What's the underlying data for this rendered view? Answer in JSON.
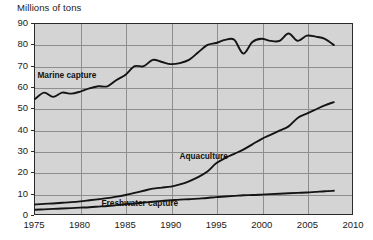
{
  "chart_data": {
    "type": "line",
    "title": "Millions of tons",
    "xlabel": "",
    "ylabel": "Millions of tons",
    "xlim": [
      1975,
      2010
    ],
    "ylim": [
      0,
      90
    ],
    "grid": true,
    "legend_position": "inline-labels",
    "xticks": [
      "1975",
      "1980",
      "1985",
      "1990",
      "1995",
      "2000",
      "2005",
      "2010"
    ],
    "yticks": [
      "0",
      "10",
      "20",
      "30",
      "40",
      "50",
      "60",
      "70",
      "80",
      "90"
    ],
    "series": [
      {
        "name": "Marine capture",
        "x": [
          1975,
          1976,
          1977,
          1978,
          1979,
          1980,
          1981,
          1982,
          1983,
          1984,
          1985,
          1986,
          1987,
          1988,
          1989,
          1990,
          1991,
          1992,
          1993,
          1994,
          1995,
          1996,
          1997,
          1998,
          1999,
          2000,
          2001,
          2002,
          2003,
          2004,
          2005,
          2006,
          2007,
          2008
        ],
        "values": [
          54.5,
          57.5,
          55.5,
          57.5,
          57.0,
          58.0,
          59.5,
          60.5,
          60.5,
          63.5,
          66.0,
          70.0,
          70.0,
          73.0,
          72.0,
          71.0,
          71.5,
          73.0,
          76.5,
          80.0,
          81.0,
          82.5,
          82.5,
          76.0,
          81.5,
          83.0,
          82.0,
          82.0,
          85.5,
          82.0,
          84.5,
          84.0,
          83.0,
          80.0
        ]
      },
      {
        "name": "Aquaculture",
        "x": [
          1975,
          1976,
          1977,
          1978,
          1979,
          1980,
          1981,
          1982,
          1983,
          1984,
          1985,
          1986,
          1987,
          1988,
          1989,
          1990,
          1991,
          1992,
          1993,
          1994,
          1995,
          1996,
          1997,
          1998,
          1999,
          2000,
          2001,
          2002,
          2003,
          2004,
          2005,
          2006,
          2007,
          2008
        ],
        "values": [
          4.5,
          4.8,
          5.0,
          5.3,
          5.6,
          6.0,
          6.5,
          7.0,
          7.5,
          8.2,
          9.0,
          10.0,
          11.0,
          12.0,
          12.5,
          13.0,
          14.0,
          15.5,
          17.5,
          20.0,
          24.0,
          26.5,
          28.5,
          30.5,
          33.0,
          35.5,
          37.5,
          39.5,
          41.5,
          45.5,
          47.5,
          49.5,
          51.5,
          53.0
        ]
      },
      {
        "name": "Freshwater capture",
        "x": [
          1975,
          1976,
          1977,
          1978,
          1979,
          1980,
          1981,
          1982,
          1983,
          1984,
          1985,
          1986,
          1987,
          1988,
          1989,
          1990,
          1991,
          1992,
          1993,
          1994,
          1995,
          1996,
          1997,
          1998,
          1999,
          2000,
          2001,
          2002,
          2003,
          2004,
          2005,
          2006,
          2007,
          2008
        ],
        "values": [
          2.0,
          2.2,
          2.4,
          2.6,
          2.8,
          3.0,
          3.2,
          3.5,
          3.8,
          4.2,
          4.6,
          5.0,
          5.4,
          5.8,
          6.2,
          6.5,
          6.8,
          7.0,
          7.3,
          7.6,
          8.0,
          8.3,
          8.6,
          8.9,
          9.0,
          9.2,
          9.4,
          9.6,
          9.8,
          10.0,
          10.2,
          10.5,
          10.8,
          11.0
        ]
      }
    ],
    "annotations": [
      {
        "text": "Marine capture",
        "x": 1978.5,
        "y": 66
      },
      {
        "text": "Aquaculture",
        "x": 1993.5,
        "y": 28
      },
      {
        "text": "Freshwater capture",
        "x": 1986.5,
        "y": 6
      }
    ]
  }
}
